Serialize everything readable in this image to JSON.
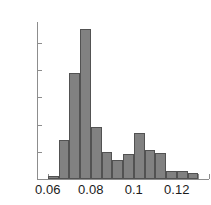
{
  "figure": {
    "title_sliver": "",
    "background_color": "#ffffff",
    "bar_fill_color": "#818181",
    "bar_edge_color": "#525252",
    "axis_color": "#8d8d8d",
    "text_color": "#1b1b1b"
  },
  "chart_data": {
    "type": "bar",
    "title": "",
    "xlabel": "",
    "ylabel": "",
    "xlim": [
      0.055,
      0.135
    ],
    "ylim": [
      0,
      58
    ],
    "grid": false,
    "legend": null,
    "bin_width": 0.005,
    "xticks": [
      0.06,
      0.08,
      0.1,
      0.12
    ],
    "xtick_labels": [
      "0.06",
      "0.08",
      "0.1",
      "0.12"
    ],
    "yticks": [
      0,
      10,
      20,
      30,
      40,
      50
    ],
    "ytick_labels": [
      "0",
      "10",
      "20",
      "30",
      "40",
      "50"
    ],
    "bin_edges": [
      0.055,
      0.06,
      0.065,
      0.07,
      0.075,
      0.08,
      0.085,
      0.09,
      0.095,
      0.1,
      0.105,
      0.11,
      0.115,
      0.12,
      0.125,
      0.13,
      0.135
    ],
    "bin_centers": [
      0.0575,
      0.0625,
      0.0675,
      0.0725,
      0.0775,
      0.0825,
      0.0875,
      0.0925,
      0.0975,
      0.1025,
      0.1075,
      0.1125,
      0.1175,
      0.1225,
      0.1275,
      0.1325
    ],
    "values": [
      0,
      1,
      14.5,
      39,
      55,
      19,
      10,
      7,
      9,
      17,
      10.5,
      9.5,
      3,
      3,
      2.3,
      0
    ]
  }
}
